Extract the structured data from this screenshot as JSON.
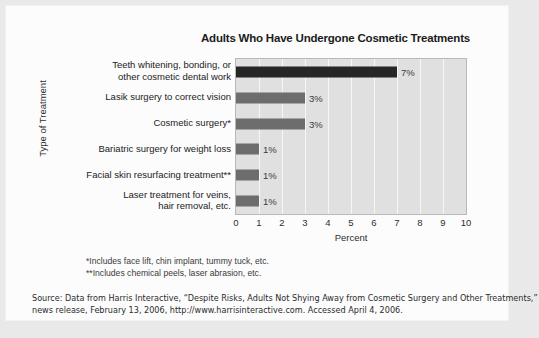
{
  "chart_data": {
    "type": "bar",
    "orientation": "horizontal",
    "title": "Adults Who Have Undergone Cosmetic Treatments",
    "xlabel": "Percent",
    "ylabel": "Type of Treatment",
    "xlim": [
      0,
      10
    ],
    "xticks": [
      "0",
      "1",
      "2",
      "3",
      "4",
      "5",
      "6",
      "7",
      "8",
      "9",
      "10"
    ],
    "grid": true,
    "legend": "none",
    "categories": [
      "Teeth whitening, bonding, or\nother cosmetic dental work",
      "Lasik surgery to correct vision",
      "Cosmetic surgery*",
      "Bariatric surgery for weight loss",
      "Facial skin resurfacing treatment**",
      "Laser treatment for veins,\nhair removal, etc."
    ],
    "values": [
      7,
      3,
      3,
      1,
      1,
      1
    ],
    "data_labels": [
      "7%",
      "3%",
      "3%",
      "1%",
      "1%",
      "1%"
    ],
    "bar_colors": [
      "#262626",
      "#6d6d6d",
      "#6d6d6d",
      "#6d6d6d",
      "#6d6d6d",
      "#6d6d6d"
    ],
    "plot_background": "#e0e0e0",
    "gridline_color": "#f6f6f6"
  },
  "footnotes": {
    "one": "*Includes face lift, chin implant, tummy tuck, etc.",
    "two": "**Includes chemical peels, laser abrasion, etc."
  },
  "source": {
    "line1": "Source: Data from Harris Interactive, “Despite Risks, Adults Not Shying Away from Cosmetic Surgery and Other Treatments,”",
    "line2": "news release, February 13, 2006, http://www.harrisinteractive.com. Accessed April 4, 2006."
  }
}
